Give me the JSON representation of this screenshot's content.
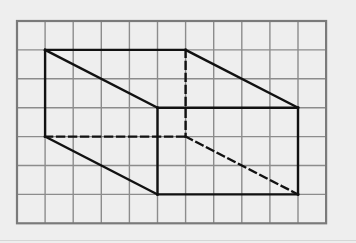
{
  "diagram": {
    "type": "isometric-grid-drawing",
    "colors": {
      "background": "#eeeeee",
      "grid_line": "#8c8c8c",
      "grid_border": "#7a7a7a",
      "solid_edge": "#111111",
      "hidden_edge": "#111111"
    },
    "grid": {
      "columns": 11,
      "rows": 7,
      "origin_x": 17,
      "origin_y": 21,
      "cell_width": 28.1,
      "cell_height": 28.9
    },
    "vertices_grid": {
      "A_top_back_left": [
        1,
        1
      ],
      "B_top_back_right": [
        6,
        1
      ],
      "C_top_front_right": [
        10,
        3
      ],
      "D_top_front_left": [
        5,
        3
      ],
      "E_bottom_back_left": [
        1,
        4
      ],
      "F_bottom_back_right": [
        6,
        4
      ],
      "G_bottom_front_right": [
        10,
        6
      ],
      "H_bottom_front_left": [
        5,
        6
      ]
    },
    "solid_edges": [
      [
        "A_top_back_left",
        "B_top_back_right"
      ],
      [
        "B_top_back_right",
        "C_top_front_right"
      ],
      [
        "C_top_front_right",
        "D_top_front_left"
      ],
      [
        "D_top_front_left",
        "A_top_back_left"
      ],
      [
        "A_top_back_left",
        "E_bottom_back_left"
      ],
      [
        "E_bottom_back_left",
        "H_bottom_front_left"
      ],
      [
        "D_top_front_left",
        "H_bottom_front_left"
      ],
      [
        "H_bottom_front_left",
        "G_bottom_front_right"
      ],
      [
        "C_top_front_right",
        "G_bottom_front_right"
      ]
    ],
    "hidden_edges": [
      [
        "B_top_back_right",
        "F_bottom_back_right"
      ],
      [
        "E_bottom_back_left",
        "F_bottom_back_right"
      ],
      [
        "F_bottom_back_right",
        "G_bottom_front_right"
      ]
    ]
  }
}
